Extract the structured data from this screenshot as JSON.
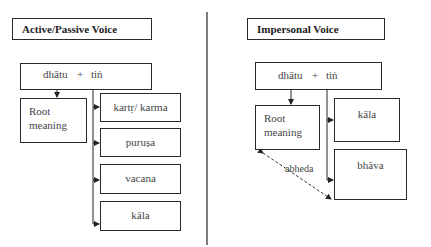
{
  "left_panel": {
    "title": "Active/Passive Voice",
    "top_box": {
      "dhatu": "dhātu",
      "plus": "+",
      "tin": "tiṅ"
    },
    "root_box": {
      "line1": "Root",
      "line2": "meaning"
    },
    "branches": [
      "kartṛ/ karma",
      "puruṣa",
      "vacana",
      "kāla"
    ]
  },
  "right_panel": {
    "title": "Impersonal Voice",
    "top_box": {
      "dhatu": "dhātu",
      "plus": "+",
      "tin": "tiṅ"
    },
    "root_box": {
      "line1": "Root",
      "line2": "meaning"
    },
    "branches": [
      "kāla",
      "bhāva"
    ],
    "relation_label": "abheda"
  },
  "colors": {
    "line": "#2a2a2a",
    "text": "#444444",
    "divider": "#333333"
  }
}
